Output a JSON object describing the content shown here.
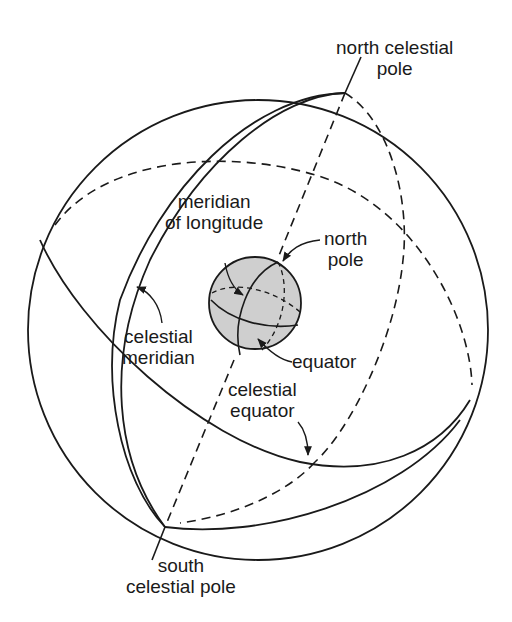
{
  "diagram": {
    "labels": {
      "north_celestial_pole": {
        "line1": "north celestial",
        "line2": "pole"
      },
      "meridian_of_longitude": {
        "line1": "meridian",
        "line2": "of longitude"
      },
      "north_pole": {
        "line1": "north",
        "line2": "pole"
      },
      "celestial_meridian": {
        "line1": "celestial",
        "line2": "meridian"
      },
      "equator": {
        "line1": "equator"
      },
      "celestial_equator": {
        "line1": "celestial",
        "line2": "equator"
      },
      "south_celestial_pole": {
        "line1": "south",
        "line2": "celestial pole"
      }
    },
    "colors": {
      "line": "#1a1a1a",
      "earth_fill": "#cfcfcf",
      "background": "#ffffff"
    }
  }
}
